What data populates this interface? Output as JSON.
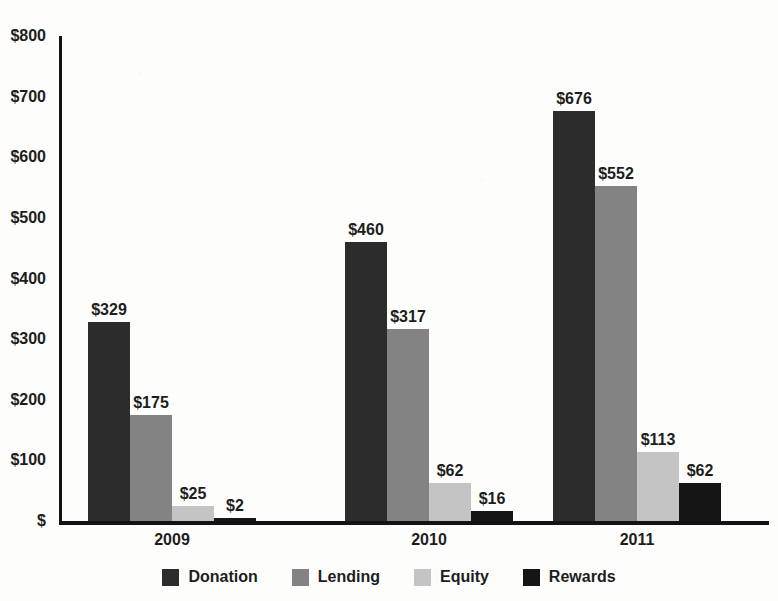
{
  "chart_data": {
    "type": "bar",
    "title": "",
    "xlabel": "",
    "ylabel": "",
    "categories": [
      "2009",
      "2010",
      "2011"
    ],
    "series": [
      {
        "name": "Donation",
        "color": "#2c2c2c",
        "values": [
          329,
          460,
          676
        ],
        "labels": [
          "$329",
          "$460",
          "$676"
        ]
      },
      {
        "name": "Lending",
        "color": "#838383",
        "values": [
          175,
          317,
          552
        ],
        "labels": [
          "$175",
          "$317",
          "$552"
        ]
      },
      {
        "name": "Equity",
        "color": "#c4c4c4",
        "values": [
          25,
          62,
          113
        ],
        "labels": [
          "$25",
          "$62",
          "$113"
        ]
      },
      {
        "name": "Rewards",
        "color": "#151515",
        "values": [
          2,
          16,
          62
        ],
        "labels": [
          "$2",
          "$16",
          "$62"
        ]
      }
    ],
    "ylim": [
      0,
      800
    ],
    "y_ticks": [
      800,
      700,
      600,
      500,
      400,
      300,
      200,
      100,
      0
    ],
    "y_tick_labels": [
      "$800",
      "$700",
      "$600",
      "$500",
      "$400",
      "$300",
      "$200",
      "$100",
      "$"
    ],
    "grid": false,
    "legend_position": "bottom",
    "value_labels_shown": true,
    "currency_prefix": "$"
  },
  "axes": {
    "y_ticks": [
      {
        "label": "$800",
        "value": 800
      },
      {
        "label": "$700",
        "value": 700
      },
      {
        "label": "$600",
        "value": 600
      },
      {
        "label": "$500",
        "value": 500
      },
      {
        "label": "$400",
        "value": 400
      },
      {
        "label": "$300",
        "value": 300
      },
      {
        "label": "$200",
        "value": 200
      },
      {
        "label": "$100",
        "value": 100
      },
      {
        "label": "$",
        "value": 0
      }
    ],
    "x_labels": [
      "2009",
      "2010",
      "2011"
    ]
  },
  "legend": {
    "items": [
      {
        "label": "Donation",
        "color": "#2c2c2c"
      },
      {
        "label": "Lending",
        "color": "#838383"
      },
      {
        "label": "Equity",
        "color": "#c4c4c4"
      },
      {
        "label": "Rewards",
        "color": "#151515"
      }
    ]
  },
  "groups": [
    {
      "category": "2009",
      "bars": [
        {
          "series": "Donation",
          "value": 329,
          "label": "$329",
          "color": "#2c2c2c"
        },
        {
          "series": "Lending",
          "value": 175,
          "label": "$175",
          "color": "#838383"
        },
        {
          "series": "Equity",
          "value": 25,
          "label": "$25",
          "color": "#c4c4c4"
        },
        {
          "series": "Rewards",
          "value": 2,
          "label": "$2",
          "color": "#151515"
        }
      ]
    },
    {
      "category": "2010",
      "bars": [
        {
          "series": "Donation",
          "value": 460,
          "label": "$460",
          "color": "#2c2c2c"
        },
        {
          "series": "Lending",
          "value": 317,
          "label": "$317",
          "color": "#838383"
        },
        {
          "series": "Equity",
          "value": 62,
          "label": "$62",
          "color": "#c4c4c4"
        },
        {
          "series": "Rewards",
          "value": 16,
          "label": "$16",
          "color": "#151515"
        }
      ]
    },
    {
      "category": "2011",
      "bars": [
        {
          "series": "Donation",
          "value": 676,
          "label": "$676",
          "color": "#2c2c2c"
        },
        {
          "series": "Lending",
          "value": 552,
          "label": "$552",
          "color": "#838383"
        },
        {
          "series": "Equity",
          "value": 113,
          "label": "$113",
          "color": "#c4c4c4"
        },
        {
          "series": "Rewards",
          "value": 62,
          "label": "$62",
          "color": "#151515"
        }
      ]
    }
  ],
  "colors": {
    "donation": "#2c2c2c",
    "lending": "#838383",
    "equity": "#c4c4c4",
    "rewards": "#151515",
    "axis": "#131313",
    "text": "#1d1d1d",
    "background": "#fdfdfc"
  }
}
